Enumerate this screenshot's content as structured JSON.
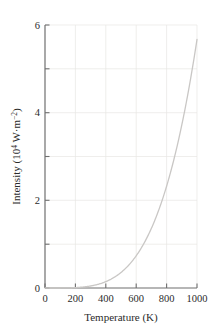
{
  "chart_data": {
    "type": "line",
    "title": "",
    "subtitle": "",
    "xlabel": "Temperature (K)",
    "ylabel": "Intensity (10⁴ W·m⁻²)",
    "ylabel_parts": {
      "lead": "Intensity (10",
      "exp1": "4",
      "mid": " W·m",
      "exp2": "−2",
      "tail": ")"
    },
    "xlim": [
      0,
      1000
    ],
    "ylim": [
      0,
      6
    ],
    "xticks": [
      0,
      200,
      400,
      600,
      800,
      1000
    ],
    "xtick_labels": [
      "0",
      "200",
      "400",
      "600",
      "800",
      "1000"
    ],
    "yticks": [
      0,
      1,
      2,
      3,
      4,
      5,
      6
    ],
    "ytick_labels": [
      "0",
      "",
      "2",
      "",
      "4",
      "",
      "6"
    ],
    "ytick_labels_major": [
      "0",
      "2",
      "4",
      "6"
    ],
    "grid": true,
    "grid_color": "#e8e6e4",
    "axis_color": "#6f6f6f",
    "line_color": "#c9c7c5",
    "line_width": 1.3,
    "legend": null,
    "legend_position": "none",
    "annotations": [],
    "relation": "Stefan-Boltzmann: I = σT⁴",
    "x": [
      0,
      50,
      100,
      150,
      200,
      250,
      300,
      350,
      400,
      450,
      500,
      550,
      600,
      650,
      700,
      750,
      800,
      850,
      900,
      950,
      1000
    ],
    "series": [
      {
        "name": "Blackbody radiant intensity",
        "values": [
          0.0,
          0.0004,
          0.0057,
          0.0287,
          0.0907,
          0.2215,
          0.4593,
          0.8509,
          1.4516,
          2.3255,
          3.5456,
          5.1937,
          7.3605,
          10.1454,
          13.6568,
          18.0118,
          23.3367,
          29.7668,
          37.4464,
          46.529,
          57.1772
        ]
      }
    ],
    "series_scaled_note": "values above are in 10² W·m⁻² units prior to scaling; plotted values are divided by 10 to express 10⁴ W·m⁻²",
    "plotted_values": [
      0.0,
      4e-05,
      0.00057,
      0.0029,
      0.0091,
      0.0222,
      0.0459,
      0.0851,
      0.1452,
      0.2326,
      0.3546,
      0.5194,
      0.7361,
      1.0145,
      1.3657,
      1.8012,
      2.3337,
      2.9767,
      3.7446,
      4.6529,
      5.67
    ],
    "endpoint": {
      "x": 1000,
      "y": 5.67
    }
  },
  "figure": {
    "background": "#ffffff"
  }
}
